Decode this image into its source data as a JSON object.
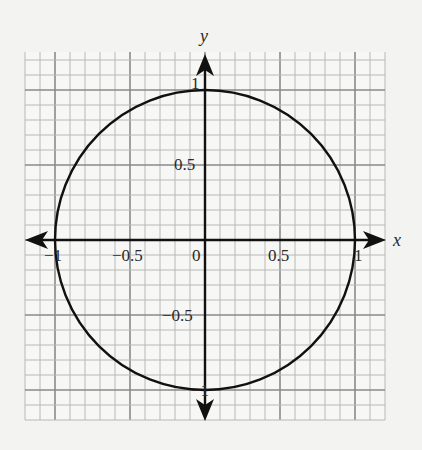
{
  "chart_data": {
    "type": "line",
    "title": "",
    "xlabel": "x",
    "ylabel": "y",
    "xlim": [
      -1.2,
      1.2
    ],
    "ylim": [
      -1.2,
      1.2
    ],
    "grid": true,
    "grid_minor_step": 0.1,
    "grid_major_step": 0.5,
    "x_ticks": [
      {
        "value": -1,
        "label": "-1"
      },
      {
        "value": -0.5,
        "label": "−0.5"
      },
      {
        "value": 0,
        "label": "0"
      },
      {
        "value": 0.5,
        "label": "0.5"
      },
      {
        "value": 1,
        "label": "1"
      }
    ],
    "y_ticks": [
      {
        "value": 1,
        "label": "1"
      },
      {
        "value": 0.5,
        "label": "0.5"
      },
      {
        "value": -0.5,
        "label": "−0.5"
      },
      {
        "value": -1,
        "label": "-1"
      }
    ],
    "series": [
      {
        "name": "unit circle x^2 + y^2 = 1",
        "shape": "circle",
        "center": [
          0,
          0
        ],
        "radius": 1
      }
    ]
  },
  "labels": {
    "x_axis": "x",
    "y_axis": "y",
    "tick_x_neg1": "−1",
    "tick_x_neg05": "−0.5",
    "tick_x_0": "0",
    "tick_x_05": "0.5",
    "tick_x_1": "1",
    "tick_y_1": "1",
    "tick_y_05": "0.5",
    "tick_y_neg05": "−0.5",
    "tick_y_neg1": "−1"
  }
}
